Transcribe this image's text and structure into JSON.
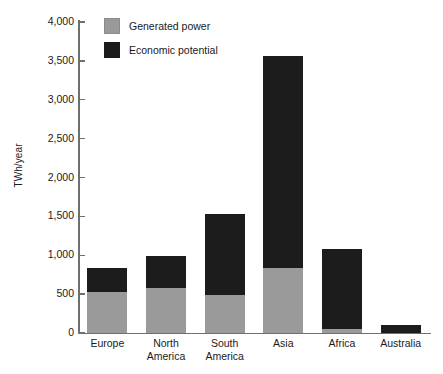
{
  "chart_data": {
    "type": "bar",
    "stacked": true,
    "title": "",
    "xlabel": "",
    "ylabel": "TWh/year",
    "ylim": [
      0,
      4000
    ],
    "yticks": [
      0,
      500,
      1000,
      1500,
      2000,
      2500,
      3000,
      3500,
      4000
    ],
    "ytick_labels": [
      "0",
      "500",
      "1,000",
      "1,500",
      "2,000",
      "2,500",
      "3,000",
      "3,500",
      "4,000"
    ],
    "grid": false,
    "legend_position": "top-left",
    "categories": [
      "Europe",
      "North America",
      "South America",
      "Asia",
      "Africa",
      "Australia"
    ],
    "category_lines": [
      [
        "Europe",
        ""
      ],
      [
        "North",
        "America"
      ],
      [
        "South",
        "America"
      ],
      [
        "Asia",
        ""
      ],
      [
        "Africa",
        ""
      ],
      [
        "Australia",
        ""
      ]
    ],
    "series": [
      {
        "name": "Generated power",
        "color": "#9a9a9a",
        "values": [
          530,
          580,
          485,
          840,
          50,
          0
        ]
      },
      {
        "name": "Economic potential",
        "color": "#1c1c1c",
        "values": [
          305,
          415,
          1050,
          2720,
          1030,
          100
        ]
      }
    ],
    "totals": [
      835,
      995,
      1535,
      3560,
      1080,
      100
    ]
  },
  "legend": {
    "items": [
      {
        "label": "Generated power",
        "swatch": "generated"
      },
      {
        "label": "Economic potential",
        "swatch": "economic"
      }
    ]
  },
  "colors": {
    "generated": "#9a9a9a",
    "economic": "#1c1c1c",
    "axis": "#6f6f6f",
    "text": "#1a1a1a",
    "background": "#ffffff"
  }
}
